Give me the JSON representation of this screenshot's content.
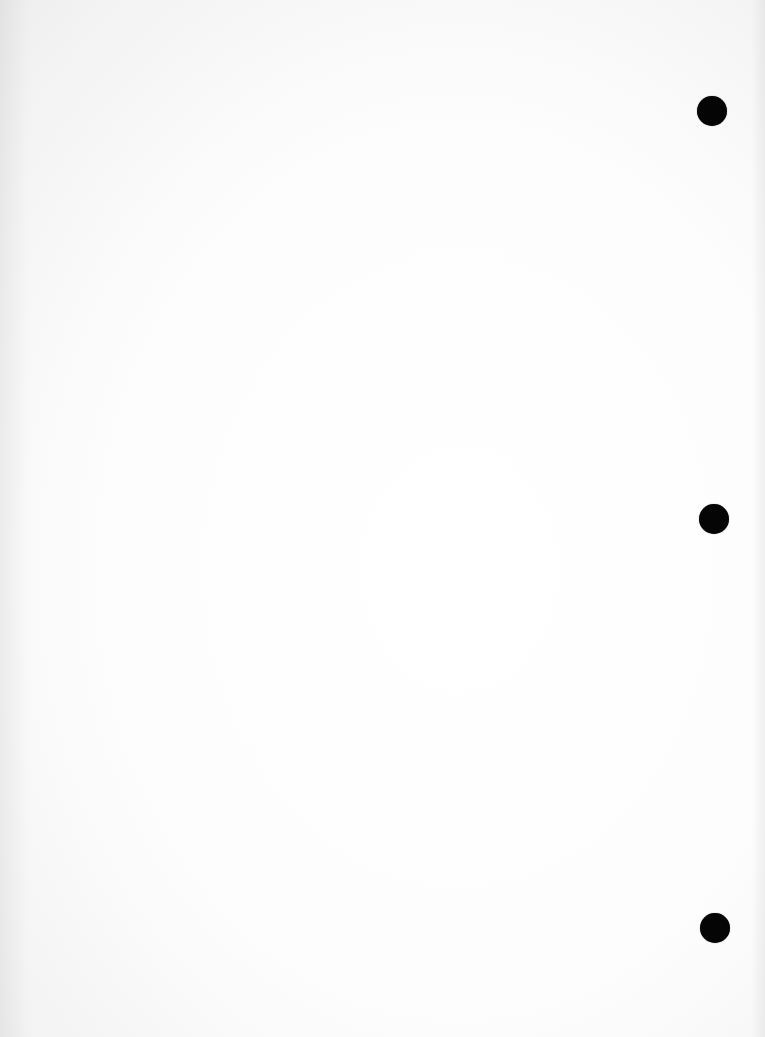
{
  "page": {
    "type": "blank scanned page",
    "background_color": "#fdfdfd",
    "hole_color": "#050505",
    "punch_holes": [
      {
        "cx": 712,
        "cy": 111,
        "r": 15
      },
      {
        "cx": 714,
        "cy": 519,
        "r": 15
      },
      {
        "cx": 715,
        "cy": 928,
        "r": 15
      }
    ]
  }
}
